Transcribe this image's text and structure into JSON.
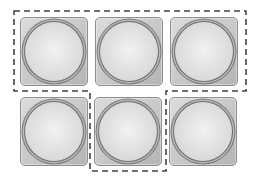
{
  "diagram": {
    "cells": [
      {
        "id": "cell-1",
        "row": 1,
        "col": 1,
        "x": 20,
        "y": 17,
        "grouped": true
      },
      {
        "id": "cell-2",
        "row": 1,
        "col": 2,
        "x": 95,
        "y": 17,
        "grouped": true
      },
      {
        "id": "cell-3",
        "row": 1,
        "col": 3,
        "x": 170,
        "y": 17,
        "grouped": true
      },
      {
        "id": "cell-4",
        "row": 2,
        "col": 1,
        "x": 20,
        "y": 97,
        "grouped": false
      },
      {
        "id": "cell-5",
        "row": 2,
        "col": 2,
        "x": 94,
        "y": 97,
        "grouped": true
      },
      {
        "id": "cell-6",
        "row": 2,
        "col": 3,
        "x": 169,
        "y": 97,
        "grouped": false
      }
    ],
    "group_outline": {
      "style": "dashed",
      "color": "#444444",
      "points": "14,11 246,11 246,91 166,91 166,171 90,171 90,91 14,91"
    },
    "colors": {
      "cell_fill": "#c9c9c9",
      "cell_border": "#8e8e8e",
      "ring": "#6f6f6f",
      "well_center": "#f2f2f2"
    }
  }
}
